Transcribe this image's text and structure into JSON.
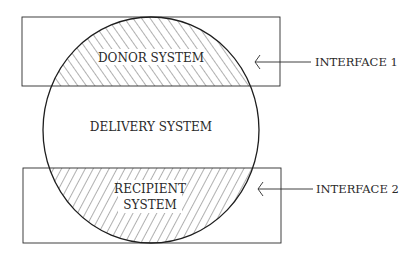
{
  "diagram": {
    "type": "interface-diagram",
    "colors": {
      "stroke": "#2a2a2a",
      "background": "#ffffff",
      "hatch": "#3a3a3a"
    },
    "regions": {
      "donor": {
        "label": "DONOR SYSTEM",
        "hatch": "backslash"
      },
      "delivery": {
        "label": "DELIVERY SYSTEM"
      },
      "recipient": {
        "label_line1": "RECIPIENT",
        "label_line2": "SYSTEM",
        "hatch": "forward-slash"
      }
    },
    "callouts": [
      {
        "id": "interface-1",
        "label": "INTERFACE 1",
        "points_to": "donor boundary"
      },
      {
        "id": "interface-2",
        "label": "INTERFACE 2",
        "points_to": "recipient boundary"
      }
    ]
  }
}
